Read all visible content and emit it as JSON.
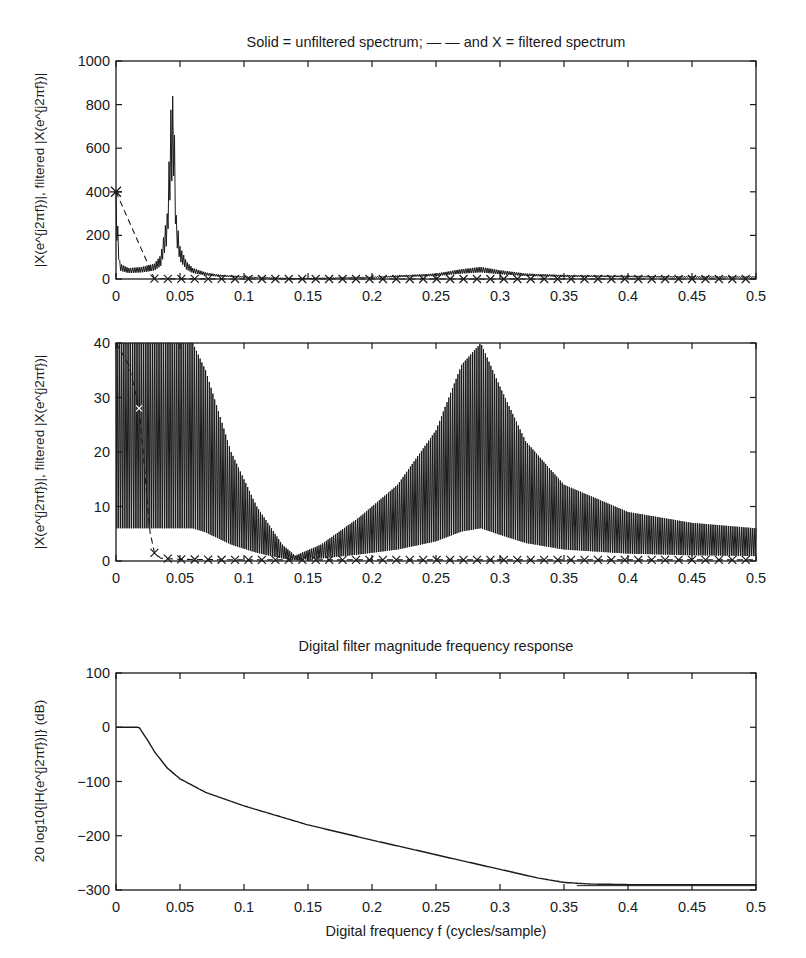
{
  "chart_data": [
    {
      "type": "line",
      "title": "Solid = unfiltered spectrum; — — and X = filtered spectrum",
      "xlabel": "",
      "ylabel": "|X(e^{j2πf})|, filtered |X(e^{j2πf})|",
      "xlim": [
        0,
        0.5
      ],
      "ylim": [
        0,
        1000
      ],
      "xticks": [
        "0",
        "0.05",
        "0.1",
        "0.15",
        "0.2",
        "0.25",
        "0.3",
        "0.35",
        "0.4",
        "0.45",
        "0.5"
      ],
      "yticks": [
        "0",
        "200",
        "400",
        "600",
        "800",
        "1000"
      ],
      "grid": false,
      "legend": "in title",
      "series": [
        {
          "name": "unfiltered spectrum",
          "style": "solid",
          "x": [
            0,
            0.003,
            0.01,
            0.02,
            0.03,
            0.035,
            0.04,
            0.043,
            0.045,
            0.047,
            0.05,
            0.055,
            0.06,
            0.07,
            0.08,
            0.1,
            0.14,
            0.2,
            0.25,
            0.27,
            0.285,
            0.3,
            0.32,
            0.35,
            0.4,
            0.45,
            0.5
          ],
          "y": [
            400,
            70,
            50,
            55,
            70,
            110,
            300,
            800,
            860,
            300,
            150,
            80,
            50,
            30,
            20,
            12,
            2,
            10,
            25,
            45,
            55,
            40,
            25,
            18,
            15,
            12,
            12
          ]
        },
        {
          "name": "filtered spectrum (X markers)",
          "style": "dashed+x",
          "x": [
            0,
            0.03,
            0.04,
            0.05,
            0.1,
            0.15,
            0.2,
            0.25,
            0.3,
            0.35,
            0.4,
            0.45,
            0.5
          ],
          "y": [
            400,
            2,
            0.5,
            0.3,
            0.2,
            0.2,
            0.2,
            0.2,
            0.2,
            0.2,
            0.2,
            0.2,
            0.2
          ]
        }
      ]
    },
    {
      "type": "line",
      "title": "",
      "xlabel": "",
      "ylabel": "|X(e^{j2πf})|, filtered |X(e^{j2πf})|",
      "xlim": [
        0,
        0.5
      ],
      "ylim": [
        0,
        40
      ],
      "xticks": [
        "0",
        "0.05",
        "0.1",
        "0.15",
        "0.2",
        "0.25",
        "0.3",
        "0.35",
        "0.4",
        "0.45",
        "0.5"
      ],
      "yticks": [
        "0",
        "10",
        "20",
        "30",
        "40"
      ],
      "grid": false,
      "series": [
        {
          "name": "unfiltered spectrum (zoomed)",
          "style": "solid",
          "x": [
            0,
            0.02,
            0.04,
            0.06,
            0.07,
            0.09,
            0.11,
            0.13,
            0.14,
            0.16,
            0.19,
            0.22,
            0.25,
            0.27,
            0.285,
            0.3,
            0.32,
            0.35,
            0.4,
            0.45,
            0.5
          ],
          "y": [
            40,
            40,
            40,
            40,
            35,
            20,
            10,
            3,
            1,
            3,
            8,
            14,
            24,
            36,
            40,
            32,
            22,
            14,
            9,
            7,
            6
          ]
        },
        {
          "name": "filtered spectrum",
          "style": "dashed+x",
          "x": [
            0,
            0.01,
            0.018,
            0.022,
            0.026,
            0.03,
            0.035,
            0.05,
            0.1,
            0.2,
            0.3,
            0.4,
            0.5
          ],
          "y": [
            40,
            36,
            28,
            18,
            6,
            1.5,
            0.5,
            0.3,
            0.2,
            0.2,
            0.2,
            0.2,
            0.2
          ]
        }
      ]
    },
    {
      "type": "line",
      "title": "Digital filter magnitude frequency response",
      "xlabel": "Digital frequency f (cycles/sample)",
      "ylabel": "20 log10{|H(e^{j2πf})|} (dB)",
      "xlim": [
        0,
        0.5
      ],
      "ylim": [
        -300,
        100
      ],
      "xticks": [
        "0",
        "0.05",
        "0.1",
        "0.15",
        "0.2",
        "0.25",
        "0.3",
        "0.35",
        "0.4",
        "0.45",
        "0.5"
      ],
      "yticks": [
        "−300",
        "−200",
        "−100",
        "0",
        "100"
      ],
      "grid": false,
      "series": [
        {
          "name": "filter magnitude response (dB)",
          "style": "solid",
          "x": [
            0,
            0.018,
            0.025,
            0.03,
            0.04,
            0.05,
            0.07,
            0.1,
            0.15,
            0.2,
            0.25,
            0.3,
            0.33,
            0.35,
            0.37,
            0.4,
            0.45,
            0.5
          ],
          "y": [
            0,
            0,
            -25,
            -45,
            -75,
            -95,
            -120,
            -145,
            -180,
            -208,
            -235,
            -262,
            -278,
            -286,
            -289,
            -290,
            -290,
            -290
          ]
        }
      ]
    }
  ],
  "layout": {
    "frames": [
      {
        "left": 116,
        "top": 61,
        "right": 756,
        "bottom": 279
      },
      {
        "left": 116,
        "top": 343,
        "right": 756,
        "bottom": 561
      },
      {
        "left": 116,
        "top": 673,
        "right": 756,
        "bottom": 890
      }
    ],
    "line_color": "#1a1a1a"
  }
}
